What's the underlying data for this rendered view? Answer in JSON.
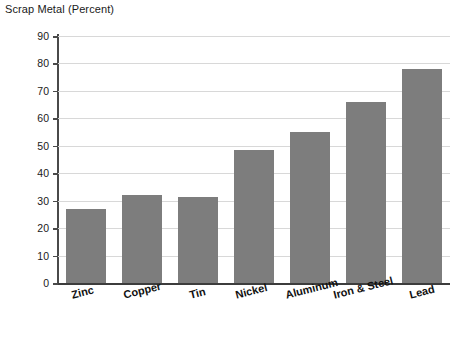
{
  "chart_data": {
    "type": "bar",
    "title": "Scrap Metal (Percent)",
    "xlabel": "",
    "ylabel": "",
    "categories": [
      "Zinc",
      "Copper",
      "Tin",
      "Nickel",
      "Aluminum",
      "Iron & Steel",
      "Lead"
    ],
    "values": [
      27,
      32,
      31.5,
      48.5,
      55,
      66,
      78
    ],
    "ylim": [
      0,
      90
    ],
    "ytick_labels": [
      "90",
      "80",
      "70",
      "60",
      "50",
      "40",
      "30",
      "20",
      "10",
      "0"
    ],
    "ytick_values": [
      90,
      80,
      70,
      60,
      50,
      40,
      30,
      20,
      10,
      0
    ],
    "ystep": 10,
    "grid": true,
    "legend": false,
    "series_color": "#7d7d7d",
    "gridline_color": "#d8d8d8",
    "axis_color": "#4a4a4a",
    "background": "#ffffff"
  }
}
